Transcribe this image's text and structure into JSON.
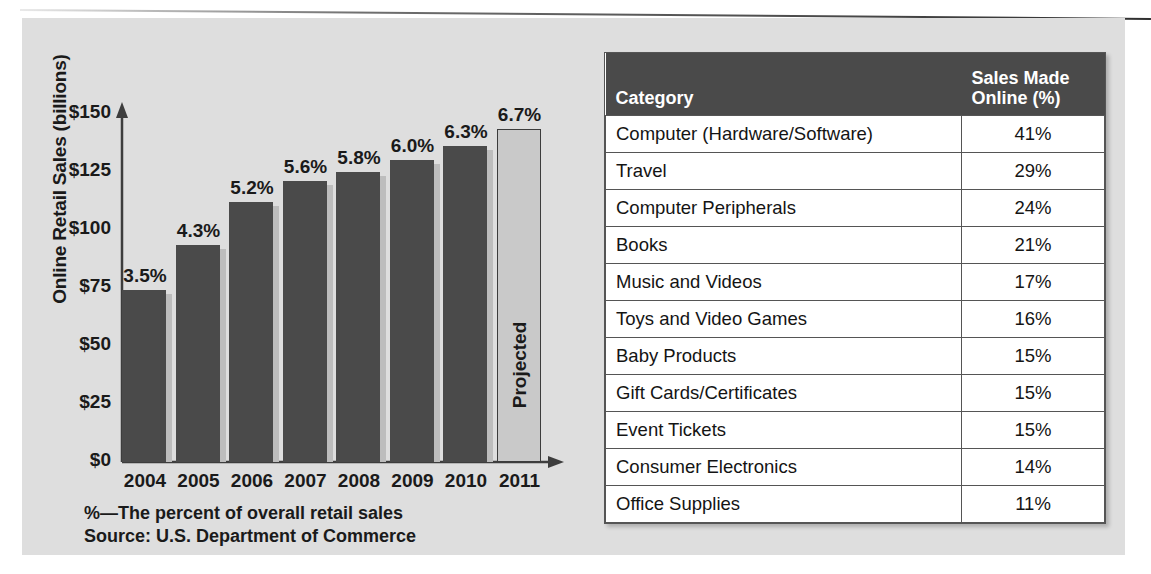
{
  "chart_data": {
    "type": "bar",
    "title": "",
    "xlabel": "",
    "ylabel": "Online Retail Sales (billions)",
    "ylim": [
      0,
      150
    ],
    "yticks": [
      "$0",
      "$25",
      "$50",
      "$75",
      "$100",
      "$125",
      "$150"
    ],
    "grid": false,
    "legend": null,
    "categories": [
      "2004",
      "2005",
      "2006",
      "2007",
      "2008",
      "2009",
      "2010",
      "2011"
    ],
    "values": [
      73,
      92,
      110,
      119,
      123,
      128,
      134,
      141
    ],
    "point_labels": [
      "3.5%",
      "4.3%",
      "5.2%",
      "5.6%",
      "5.8%",
      "6.0%",
      "6.3%",
      "6.7%"
    ],
    "bars": [
      {
        "year": "2004",
        "sales_billions": 73,
        "percent_label": "3.5%",
        "projected": false
      },
      {
        "year": "2005",
        "sales_billions": 92,
        "percent_label": "4.3%",
        "projected": false
      },
      {
        "year": "2006",
        "sales_billions": 110,
        "percent_label": "5.2%",
        "projected": false
      },
      {
        "year": "2007",
        "sales_billions": 119,
        "percent_label": "5.6%",
        "projected": false
      },
      {
        "year": "2008",
        "sales_billions": 123,
        "percent_label": "5.8%",
        "projected": false
      },
      {
        "year": "2009",
        "sales_billions": 128,
        "percent_label": "6.0%",
        "projected": false
      },
      {
        "year": "2010",
        "sales_billions": 134,
        "percent_label": "6.3%",
        "projected": false
      },
      {
        "year": "2011",
        "sales_billions": 141,
        "percent_label": "6.7%",
        "projected": true
      }
    ],
    "annotations": [
      "Projected"
    ],
    "footnotes": [
      "%—The percent of overall retail sales",
      "Source: U.S. Department of Commerce"
    ],
    "colors": {
      "bar": "#4a4a4a",
      "projected_bar": "#c9c9c9",
      "background": "#dedede",
      "text": "#1a1a1a"
    }
  },
  "chart": {
    "ylabel": "Online Retail Sales (billions)",
    "yticks": [
      "$150",
      "$125",
      "$100",
      "$75",
      "$50",
      "$25",
      "$0"
    ],
    "projected_label": "Projected",
    "footnote_1": "%—The percent of overall retail sales",
    "footnote_2": "Source: U.S. Department of Commerce"
  },
  "table": {
    "headers": {
      "category": "Category",
      "percent_line1": "Sales Made",
      "percent_line2": "Online (%)"
    },
    "rows": [
      {
        "category": "Computer (Hardware/Software)",
        "percent": "41%"
      },
      {
        "category": "Travel",
        "percent": "29%"
      },
      {
        "category": "Computer Peripherals",
        "percent": "24%"
      },
      {
        "category": "Books",
        "percent": "21%"
      },
      {
        "category": "Music and Videos",
        "percent": "17%"
      },
      {
        "category": "Toys and Video Games",
        "percent": "16%"
      },
      {
        "category": "Baby Products",
        "percent": "15%"
      },
      {
        "category": "Gift Cards/Certificates",
        "percent": "15%"
      },
      {
        "category": "Event Tickets",
        "percent": "15%"
      },
      {
        "category": "Consumer Electronics",
        "percent": "14%"
      },
      {
        "category": "Office Supplies",
        "percent": "11%"
      }
    ]
  }
}
